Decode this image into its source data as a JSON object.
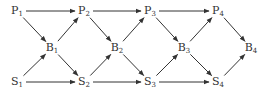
{
  "diagram": {
    "nodes": [
      {
        "id": "P1",
        "base": "P",
        "sub": "1",
        "x": 17,
        "y": 11
      },
      {
        "id": "P2",
        "base": "P",
        "sub": "2",
        "x": 84,
        "y": 11
      },
      {
        "id": "P3",
        "base": "P",
        "sub": "3",
        "x": 150,
        "y": 11
      },
      {
        "id": "P4",
        "base": "P",
        "sub": "4",
        "x": 218,
        "y": 11
      },
      {
        "id": "B1",
        "base": "B",
        "sub": "1",
        "x": 52,
        "y": 48
      },
      {
        "id": "B2",
        "base": "B",
        "sub": "2",
        "x": 117,
        "y": 48
      },
      {
        "id": "B3",
        "base": "B",
        "sub": "3",
        "x": 184,
        "y": 48
      },
      {
        "id": "B4",
        "base": "B",
        "sub": "4",
        "x": 251,
        "y": 48
      },
      {
        "id": "S1",
        "base": "S",
        "sub": "1",
        "x": 17,
        "y": 82
      },
      {
        "id": "S2",
        "base": "S",
        "sub": "2",
        "x": 84,
        "y": 82
      },
      {
        "id": "S3",
        "base": "S",
        "sub": "3",
        "x": 150,
        "y": 82
      },
      {
        "id": "S4",
        "base": "S",
        "sub": "4",
        "x": 218,
        "y": 82
      }
    ],
    "edges": [
      [
        "P1",
        "P2"
      ],
      [
        "P2",
        "P3"
      ],
      [
        "P3",
        "P4"
      ],
      [
        "S1",
        "S2"
      ],
      [
        "S2",
        "S3"
      ],
      [
        "S3",
        "S4"
      ],
      [
        "P1",
        "B1"
      ],
      [
        "S1",
        "B1"
      ],
      [
        "B1",
        "P2"
      ],
      [
        "B1",
        "S2"
      ],
      [
        "P2",
        "B2"
      ],
      [
        "S2",
        "B2"
      ],
      [
        "B2",
        "P3"
      ],
      [
        "B2",
        "S3"
      ],
      [
        "P3",
        "B3"
      ],
      [
        "S3",
        "B3"
      ],
      [
        "B3",
        "P4"
      ],
      [
        "B3",
        "S4"
      ],
      [
        "P4",
        "B4"
      ],
      [
        "S4",
        "B4"
      ]
    ],
    "colors": {
      "stroke": "#333333",
      "text": "#333333"
    }
  }
}
